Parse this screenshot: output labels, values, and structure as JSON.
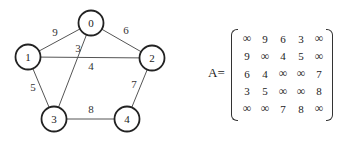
{
  "graph": {
    "nodes": [
      {
        "id": "0",
        "label": "0"
      },
      {
        "id": "1",
        "label": "1"
      },
      {
        "id": "2",
        "label": "2"
      },
      {
        "id": "3",
        "label": "3"
      },
      {
        "id": "4",
        "label": "4"
      }
    ],
    "edges": [
      {
        "from": "0",
        "to": "1",
        "weight": "9"
      },
      {
        "from": "0",
        "to": "2",
        "weight": "6"
      },
      {
        "from": "0",
        "to": "3",
        "weight": "3"
      },
      {
        "from": "1",
        "to": "2",
        "weight": "4"
      },
      {
        "from": "1",
        "to": "3",
        "weight": "5"
      },
      {
        "from": "2",
        "to": "4",
        "weight": "7"
      },
      {
        "from": "3",
        "to": "4",
        "weight": "8"
      }
    ]
  },
  "matrix": {
    "label": "A=",
    "rows": [
      [
        "∞",
        "9",
        "6",
        "3",
        "∞"
      ],
      [
        "9",
        "∞",
        "4",
        "5",
        "∞"
      ],
      [
        "6",
        "4",
        "∞",
        "∞",
        "7"
      ],
      [
        "3",
        "5",
        "∞",
        "∞",
        "8"
      ],
      [
        "∞",
        "∞",
        "7",
        "8",
        "∞"
      ]
    ]
  }
}
